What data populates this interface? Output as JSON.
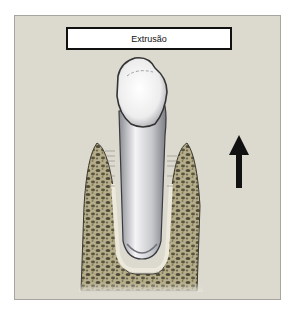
{
  "title": "Extrusão",
  "arrow": {
    "direction": "up",
    "color": "#111111"
  },
  "colors": {
    "background": "#dcd9cf",
    "bone": "#bcb48c",
    "bone_dark": "#4a4536",
    "tooth": "#e8e8ea"
  }
}
